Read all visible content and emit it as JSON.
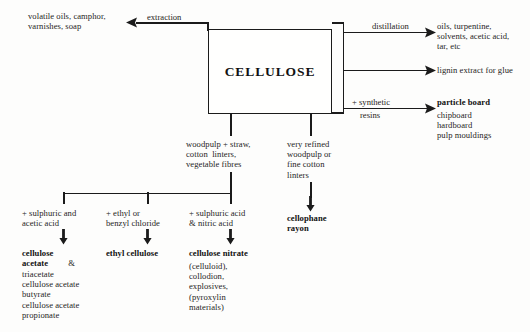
{
  "diagram": {
    "title": "CELLULOSE",
    "center_node": {
      "label": "CELLULOSE"
    },
    "branches": {
      "extraction": {
        "edge_label": "extraction",
        "target": "volatile oils, camphor,\nvarnishes, soap"
      },
      "distillation": {
        "edge_label": "distillation",
        "target": "oils, turpentine,\nsolvents, acetic acid,\ntar, etc"
      },
      "lignin": {
        "edge_label": "",
        "target": "lignin extract for glue"
      },
      "resins": {
        "edge_label_line1": "+ synthetic",
        "edge_label_line2": "resins",
        "target_bold": "particle board",
        "target_list": "chipboard\nhardboard\npulp mouldings"
      }
    },
    "feedstocks": {
      "left": "woodpulp + straw,\ncotton  linters,\nvegetable fibres",
      "right": "very refined\nwoodpulp or\nfine cotton\nlinters"
    },
    "reactions": [
      {
        "reagent": "+ sulphuric and\nacetic acid",
        "product_bold": "cellulose\nacetate",
        "product_bold_suffix": " &",
        "product_list": "triacetate\ncellulose acetate\nbutyrate\ncellulose acetate\npropionate"
      },
      {
        "reagent": "+ ethyl or\nbenzyl chloride",
        "product_bold": "ethyl cellulose",
        "product_bold_suffix": "",
        "product_list": ""
      },
      {
        "reagent": "+ sulphuric acid\n& nitric acid",
        "product_bold": "cellulose nitrate",
        "product_bold_suffix": "",
        "product_list": "(celluloid),\ncollodion,\nexplosives,\n(pyroxylin\nmaterials)"
      }
    ],
    "rayon_product": "cellophane\nrayon",
    "colors": {
      "ink": "#1b1b1b",
      "paper": "#fdfdfc"
    }
  }
}
